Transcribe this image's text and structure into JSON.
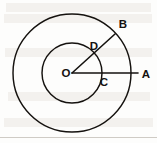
{
  "figure": {
    "background_color": "#fdfdfc",
    "stroke_color": "#15120f",
    "labels": {
      "center": "O",
      "outer_point_right": "A",
      "outer_point_upper_right": "B",
      "inner_point_right": "C",
      "inner_point_upper_right": "D"
    },
    "geometry": {
      "center_x": 72,
      "center_y": 73,
      "outer_radius": 59,
      "inner_radius": 30,
      "radius_oa_angle_deg": 0,
      "radius_ob_angle_deg": 45
    }
  }
}
